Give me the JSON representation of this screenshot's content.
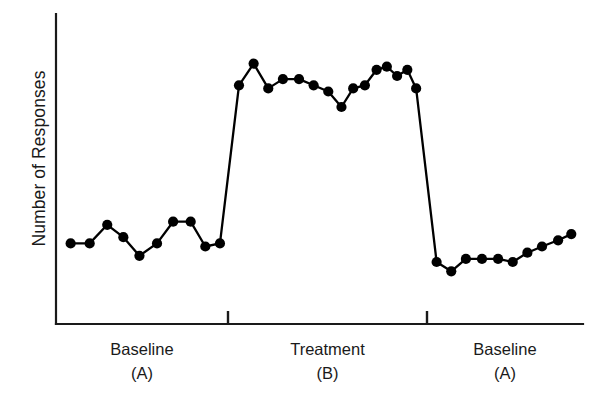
{
  "chart_data": {
    "type": "line",
    "title": "",
    "subtitle": "",
    "xlabel": "",
    "ylabel": "Number of Responses",
    "grid": false,
    "legend": null,
    "axis_ticks": {
      "x": [],
      "y": []
    },
    "xlim": [
      0,
      36
    ],
    "ylim": [
      0,
      10
    ],
    "design": "ABA reversal (withdrawal) single-subject design",
    "phases": [
      {
        "name": "Baseline",
        "code": "(A)",
        "label": "Baseline (A)",
        "x_start": 0,
        "x_end": 11.5,
        "series_name": "Number of Responses",
        "x": [
          1,
          2.3,
          3.5,
          4.6,
          5.7,
          6.9,
          8.0,
          9.2,
          10.2,
          11.2
        ],
        "values": [
          2.6,
          2.6,
          3.2,
          2.8,
          2.2,
          2.6,
          3.3,
          3.3,
          2.5,
          2.6
        ]
      },
      {
        "name": "Treatment",
        "code": "(B)",
        "label": "Treatment (B)",
        "x_start": 11.5,
        "x_end": 25.0,
        "series_name": "Number of Responses",
        "x": [
          12.5,
          13.5,
          14.5,
          15.5,
          16.6,
          17.6,
          18.6,
          19.5,
          20.3,
          21.1,
          21.9,
          22.6,
          23.3,
          24.0,
          24.6
        ],
        "values": [
          7.7,
          8.4,
          7.6,
          7.9,
          7.9,
          7.7,
          7.5,
          7.0,
          7.6,
          7.7,
          8.2,
          8.3,
          8.0,
          8.2,
          7.6
        ]
      },
      {
        "name": "Baseline",
        "code": "(A)",
        "label": "Baseline (A)",
        "x_start": 25.0,
        "x_end": 36,
        "series_name": "Number of Responses",
        "x": [
          26.0,
          27.0,
          28.0,
          29.1,
          30.2,
          31.2,
          32.2,
          33.2,
          34.3,
          35.2
        ],
        "values": [
          2.0,
          1.7,
          2.1,
          2.1,
          2.1,
          2.0,
          2.3,
          2.5,
          2.7,
          2.9
        ]
      }
    ],
    "phase_change_lines": [
      11.5,
      25.0
    ],
    "marker": "filled-circle",
    "line_color": "#000000",
    "marker_color": "#000000",
    "axis_color": "#1a1a1a"
  },
  "axis": {
    "y_title": "Number of Responses"
  },
  "captions": {
    "phase1_name": "Baseline",
    "phase1_code": "(A)",
    "phase2_name": "Treatment",
    "phase2_code": "(B)",
    "phase3_name": "Baseline",
    "phase3_code": "(A)"
  }
}
